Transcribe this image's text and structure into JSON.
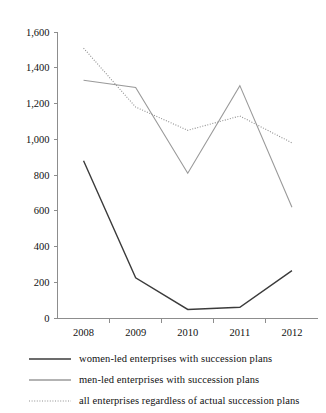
{
  "chart_data": {
    "type": "line",
    "title": "",
    "xlabel": "",
    "ylabel": "",
    "categories": [
      "2008",
      "2009",
      "2010",
      "2011",
      "2012"
    ],
    "ylim": [
      0,
      1600
    ],
    "ytick_values": [
      0,
      200,
      400,
      600,
      800,
      1000,
      1200,
      1400,
      1600
    ],
    "ytick_labels": [
      "0",
      "200",
      "400",
      "600",
      "800",
      "1,000",
      "1,200",
      "1,400",
      "1,600"
    ],
    "grid": false,
    "legend_position": "bottom",
    "series": [
      {
        "name": "women-led enterprises with succession plans",
        "values": [
          880,
          225,
          48,
          60,
          265
        ],
        "color": "#3b3b3b",
        "style": "solid",
        "width": 1.4
      },
      {
        "name": "men-led enterprises with succession plans",
        "values": [
          1330,
          1290,
          810,
          1300,
          620
        ],
        "color": "#9a9a9a",
        "style": "solid",
        "width": 1.1
      },
      {
        "name": "all enterprises regardless of actual succession plans",
        "values": [
          1510,
          1180,
          1050,
          1130,
          980
        ],
        "color": "#8f8f8f",
        "style": "dotted",
        "width": 1.1
      }
    ]
  },
  "legend": {
    "items": [
      {
        "label": "women-led enterprises with succession plans"
      },
      {
        "label": "men-led enterprises with succession plans"
      },
      {
        "label": "all enterprises regardless of actual succession plans"
      }
    ]
  }
}
